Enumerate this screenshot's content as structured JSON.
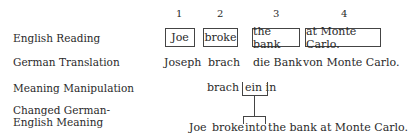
{
  "row_labels": {
    "english_reading": "English Reading",
    "german_translation": "German Translation",
    "meaning_manipulation": "Meaning Manipulation",
    "changed_meaning_line1": "Changed German-",
    "changed_meaning_line2": "English Meaning"
  },
  "columns": [
    {
      "number": "1",
      "english": "Joe",
      "german": "Joseph"
    },
    {
      "number": "2",
      "english": "broke",
      "german": "brach"
    },
    {
      "number": "3",
      "english": "the bank",
      "german": "die Bank"
    },
    {
      "number": "4",
      "english": "at Monte Carlo.",
      "german": "von Monte Carlo."
    }
  ],
  "manipulation": {
    "verb": "brach",
    "particle": "ein in"
  },
  "changed": {
    "subject": "Joe",
    "verb": "broke",
    "inserted": "into",
    "rest": "the bank at Monte Carlo."
  }
}
